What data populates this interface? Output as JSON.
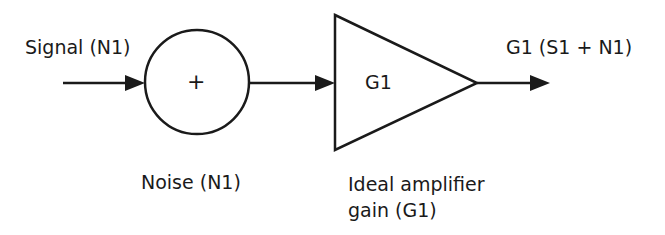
{
  "diagram": {
    "labels": {
      "input_signal": "Signal (N1)",
      "summing_symbol": "+",
      "amplifier_gain": "G1",
      "output": "G1 (S1 + N1)",
      "noise": "Noise (N1)",
      "amplifier_caption_line1": "Ideal amplifier",
      "amplifier_caption_line2": "gain (G1)"
    },
    "colors": {
      "stroke": "#1a1a1a",
      "background": "#ffffff"
    }
  }
}
